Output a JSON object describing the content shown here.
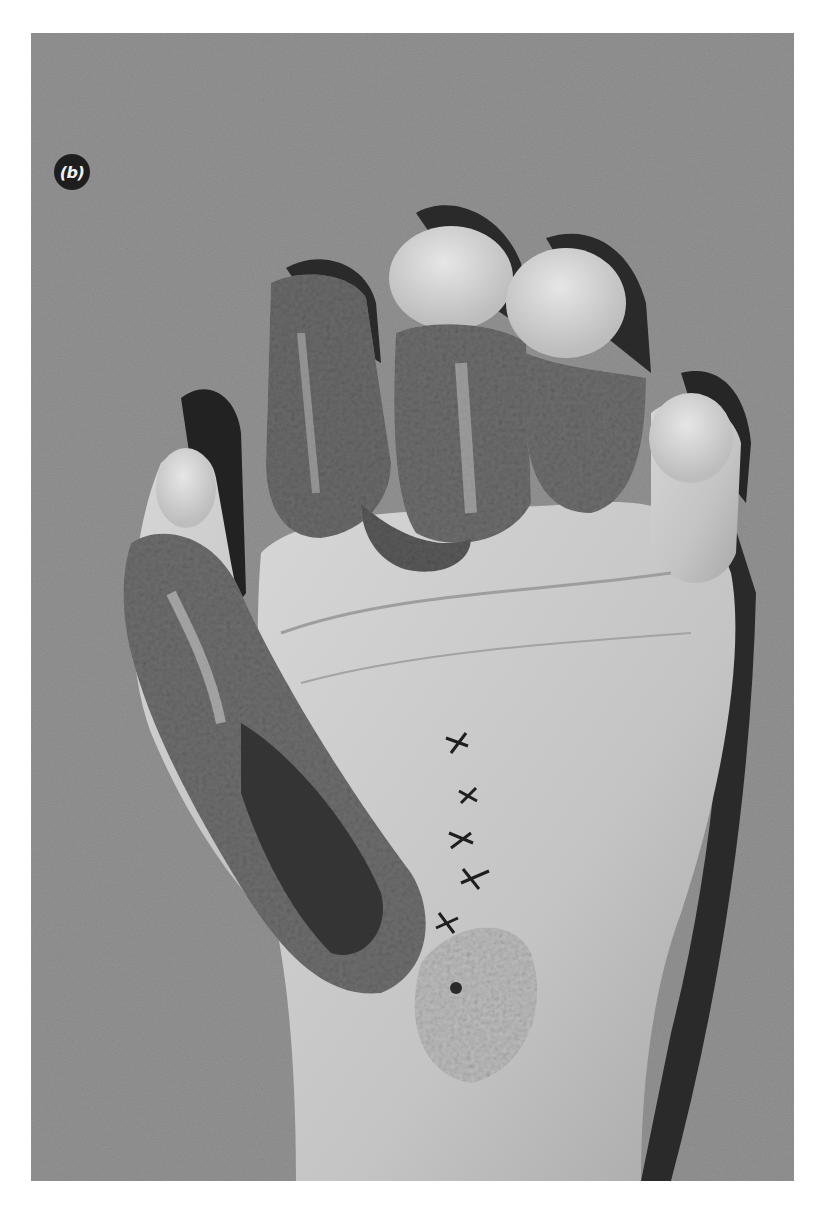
{
  "figure": {
    "panel_label": "(b)",
    "colors": {
      "page_background": "#ffffff",
      "photo_background": "#939393",
      "label_circle": "#1e1e1e",
      "label_text": "#f2f2f2"
    }
  }
}
